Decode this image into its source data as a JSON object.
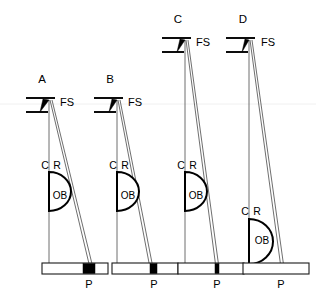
{
  "figure": {
    "background_color": "#ffffff",
    "line_color": "#000000",
    "fill_color": "#000000",
    "width": 316,
    "height": 302
  },
  "labels": {
    "front_sight": "FS",
    "center_line": "C",
    "ray_line": "R",
    "objective_block": "OB",
    "plate_point": "P"
  },
  "panels": [
    {
      "id": "A",
      "label": "A",
      "label_x": 42,
      "label_y": 80,
      "apex_x": 49,
      "apex_y": 100,
      "fs_label_x": 60,
      "fs_label_y": 103,
      "fs_upper_y": 98,
      "fs_lower_y": 112,
      "fs_left_x": 26,
      "fs_wedge_width": 9,
      "c_line_x": 49,
      "c_line_bottom": 268,
      "r_line_bottom_x": 90,
      "cr_label_y": 166,
      "c_label_x": 45,
      "r_label_x": 57,
      "ob_top_y": 172,
      "ob_bottom_y": 211,
      "ob_radius": 22,
      "ob_label_x": 60,
      "ob_label_y": 196,
      "bar_x": 42,
      "bar_y": 263,
      "bar_width": 66,
      "bar_height": 11,
      "black_seg_x": 83,
      "black_seg_width": 12,
      "p_label_x": 89,
      "p_label_y": 285
    },
    {
      "id": "B",
      "label": "B",
      "label_x": 110,
      "label_y": 80,
      "apex_x": 117,
      "apex_y": 100,
      "fs_label_x": 128,
      "fs_label_y": 103,
      "fs_upper_y": 98,
      "fs_lower_y": 112,
      "fs_left_x": 94,
      "fs_wedge_width": 8,
      "c_line_x": 117,
      "c_line_bottom": 268,
      "r_line_bottom_x": 150,
      "cr_label_y": 166,
      "c_label_x": 113,
      "r_label_x": 125,
      "ob_top_y": 172,
      "ob_bottom_y": 211,
      "ob_radius": 22,
      "ob_label_x": 128,
      "ob_label_y": 196,
      "bar_x": 112,
      "bar_y": 263,
      "bar_width": 66,
      "bar_height": 11,
      "black_seg_x": 150,
      "black_seg_width": 7,
      "p_label_x": 154,
      "p_label_y": 285
    },
    {
      "id": "C",
      "label": "C",
      "label_x": 178,
      "label_y": 20,
      "apex_x": 185,
      "apex_y": 40,
      "fs_label_x": 196,
      "fs_label_y": 43,
      "fs_upper_y": 38,
      "fs_lower_y": 52,
      "fs_left_x": 162,
      "fs_wedge_width": 8,
      "c_line_x": 185,
      "c_line_bottom": 268,
      "r_line_bottom_x": 216,
      "cr_label_y": 166,
      "c_label_x": 181,
      "r_label_x": 193,
      "ob_top_y": 172,
      "ob_bottom_y": 211,
      "ob_radius": 22,
      "ob_label_x": 196,
      "ob_label_y": 196,
      "bar_x": 178,
      "bar_y": 263,
      "bar_width": 66,
      "bar_height": 11,
      "black_seg_x": 215,
      "black_seg_width": 4,
      "p_label_x": 217,
      "p_label_y": 285
    },
    {
      "id": "D",
      "label": "D",
      "label_x": 243,
      "label_y": 20,
      "apex_x": 249,
      "apex_y": 40,
      "fs_label_x": 261,
      "fs_label_y": 43,
      "fs_upper_y": 38,
      "fs_lower_y": 52,
      "fs_left_x": 226,
      "fs_wedge_width": 7,
      "c_line_x": 249,
      "c_line_bottom": 268,
      "r_line_bottom_x": 281,
      "cr_label_y": 212,
      "c_label_x": 245,
      "r_label_x": 257,
      "ob_top_y": 219,
      "ob_bottom_y": 264,
      "ob_radius": 24,
      "ob_label_x": 262,
      "ob_label_y": 241,
      "bar_x": 243,
      "bar_y": 263,
      "bar_width": 66,
      "bar_height": 11,
      "black_seg_x": 0,
      "black_seg_width": 0,
      "p_label_x": 281,
      "p_label_y": 285
    }
  ]
}
